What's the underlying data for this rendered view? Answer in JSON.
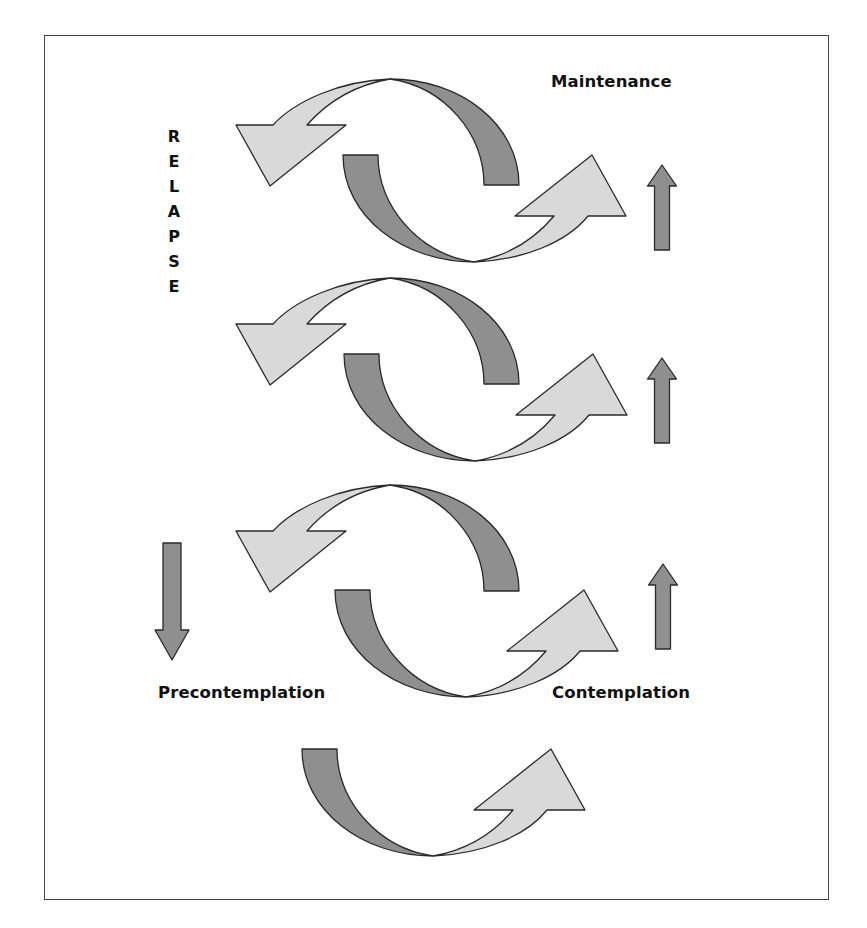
{
  "figure": {
    "labels": {
      "maintenance": "Maintenance",
      "precontemplation": "Precontemplation",
      "contemplation": "Contemplation",
      "relapse_letters": [
        "R",
        "E",
        "L",
        "A",
        "P",
        "S",
        "E"
      ]
    },
    "colors": {
      "dark_fill": "#8f8f8f",
      "light_fill": "#d9d9d9",
      "stroke": "#2a2a2a",
      "border": "#444444",
      "text": "#111111"
    },
    "cycles": [
      {
        "name": "cycle-1",
        "position": "top"
      },
      {
        "name": "cycle-2",
        "position": "upper-middle"
      },
      {
        "name": "cycle-3",
        "position": "lower-middle"
      },
      {
        "name": "cycle-4",
        "position": "bottom-partial"
      }
    ],
    "straight_arrows": [
      {
        "name": "up-arrow-1",
        "direction": "up"
      },
      {
        "name": "up-arrow-2",
        "direction": "up"
      },
      {
        "name": "up-arrow-3",
        "direction": "up"
      },
      {
        "name": "down-arrow",
        "direction": "down"
      }
    ]
  }
}
